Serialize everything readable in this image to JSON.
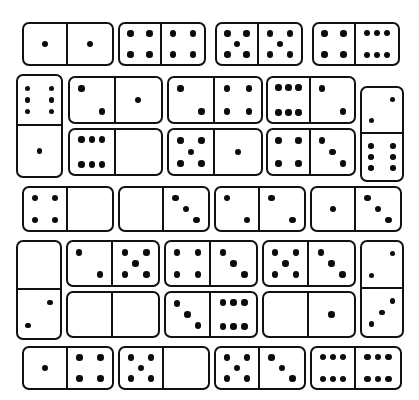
{
  "style": {
    "background": "#ffffff",
    "tile_fill": "#ffffff",
    "tile_border": "#111111",
    "pip_color": "#0c0c0c"
  },
  "board": {
    "width": 419,
    "height": 400,
    "tile_count": 28
  },
  "pip_layouts": {
    "0": [],
    "1": [
      [
        50,
        50
      ]
    ],
    "2": [
      [
        26,
        24
      ],
      [
        74,
        76
      ]
    ],
    "3": [
      [
        26,
        24
      ],
      [
        50,
        50
      ],
      [
        74,
        76
      ]
    ],
    "4": [
      [
        26,
        24
      ],
      [
        74,
        24
      ],
      [
        26,
        76
      ],
      [
        74,
        76
      ]
    ],
    "5": [
      [
        26,
        24
      ],
      [
        74,
        24
      ],
      [
        50,
        50
      ],
      [
        26,
        76
      ],
      [
        74,
        76
      ]
    ],
    "6": [
      [
        26,
        22
      ],
      [
        50,
        22
      ],
      [
        74,
        22
      ],
      [
        26,
        78
      ],
      [
        50,
        78
      ],
      [
        74,
        78
      ]
    ]
  },
  "tiles": [
    {
      "id": "t1",
      "name": "domino-1-1",
      "orientation": "horizontal",
      "values": [
        1,
        1
      ],
      "label": "1-1",
      "x": 22,
      "y": 22,
      "w": 92,
      "h": 44
    },
    {
      "id": "t2",
      "name": "domino-4-4",
      "orientation": "horizontal",
      "values": [
        4,
        4
      ],
      "label": "4-4",
      "x": 118,
      "y": 22,
      "w": 88,
      "h": 44
    },
    {
      "id": "t3",
      "name": "domino-5-5",
      "orientation": "horizontal",
      "values": [
        5,
        5
      ],
      "label": "5-5",
      "x": 215,
      "y": 22,
      "w": 88,
      "h": 44
    },
    {
      "id": "t4",
      "name": "domino-4-6",
      "orientation": "horizontal",
      "values": [
        4,
        6
      ],
      "label": "4-6",
      "x": 312,
      "y": 22,
      "w": 88,
      "h": 44
    },
    {
      "id": "t5",
      "name": "domino-6-1",
      "orientation": "vertical",
      "values": [
        6,
        1
      ],
      "label": "6-1",
      "x": 16,
      "y": 74,
      "w": 47,
      "h": 104
    },
    {
      "id": "t6",
      "name": "domino-2-1",
      "orientation": "horizontal",
      "values": [
        2,
        1
      ],
      "label": "2-1",
      "x": 68,
      "y": 76,
      "w": 95,
      "h": 48
    },
    {
      "id": "t7",
      "name": "domino-6-0",
      "orientation": "horizontal",
      "values": [
        6,
        0
      ],
      "label": "6-0",
      "x": 68,
      "y": 128,
      "w": 95,
      "h": 48
    },
    {
      "id": "t8",
      "name": "domino-2-4",
      "orientation": "horizontal",
      "values": [
        2,
        4
      ],
      "label": "2-4",
      "x": 167,
      "y": 76,
      "w": 96,
      "h": 48
    },
    {
      "id": "t9",
      "name": "domino-5-1",
      "orientation": "horizontal",
      "values": [
        5,
        1
      ],
      "label": "5-1",
      "x": 167,
      "y": 128,
      "w": 96,
      "h": 48
    },
    {
      "id": "t10",
      "name": "domino-6-2",
      "orientation": "horizontal",
      "values": [
        6,
        2
      ],
      "label": "6-2",
      "x": 266,
      "y": 76,
      "w": 90,
      "h": 48
    },
    {
      "id": "t11",
      "name": "domino-4-3",
      "orientation": "horizontal",
      "values": [
        4,
        3
      ],
      "label": "4-3",
      "x": 266,
      "y": 128,
      "w": 90,
      "h": 48
    },
    {
      "id": "t12",
      "name": "domino-2-6",
      "orientation": "vertical",
      "values": [
        2,
        6
      ],
      "label": "2-6",
      "x": 360,
      "y": 86,
      "w": 44,
      "h": 96
    },
    {
      "id": "t13",
      "name": "domino-4-0",
      "orientation": "horizontal",
      "values": [
        4,
        0
      ],
      "label": "4-0",
      "x": 22,
      "y": 186,
      "w": 92,
      "h": 46
    },
    {
      "id": "t14",
      "name": "domino-0-3",
      "orientation": "horizontal",
      "values": [
        0,
        3
      ],
      "label": "0-3",
      "x": 118,
      "y": 186,
      "w": 92,
      "h": 46
    },
    {
      "id": "t15",
      "name": "domino-2-2",
      "orientation": "horizontal",
      "values": [
        2,
        2
      ],
      "label": "2-2",
      "x": 214,
      "y": 186,
      "w": 92,
      "h": 46
    },
    {
      "id": "t16",
      "name": "domino-1-3",
      "orientation": "horizontal",
      "values": [
        1,
        3
      ],
      "label": "1-3",
      "x": 310,
      "y": 186,
      "w": 92,
      "h": 46
    },
    {
      "id": "t17",
      "name": "domino-0-2",
      "orientation": "vertical",
      "values": [
        0,
        2
      ],
      "label": "0-2",
      "x": 16,
      "y": 240,
      "w": 46,
      "h": 100
    },
    {
      "id": "t18",
      "name": "domino-2-5",
      "orientation": "horizontal",
      "values": [
        2,
        5
      ],
      "label": "2-5",
      "x": 66,
      "y": 240,
      "w": 94,
      "h": 47
    },
    {
      "id": "t19",
      "name": "domino-0-0",
      "orientation": "horizontal",
      "values": [
        0,
        0
      ],
      "label": "0-0",
      "x": 66,
      "y": 291,
      "w": 94,
      "h": 47
    },
    {
      "id": "t20",
      "name": "domino-4-3b",
      "orientation": "horizontal",
      "values": [
        4,
        3
      ],
      "label": "4-3",
      "x": 164,
      "y": 240,
      "w": 94,
      "h": 47
    },
    {
      "id": "t21",
      "name": "domino-3-6",
      "orientation": "horizontal",
      "values": [
        3,
        6
      ],
      "label": "3-6",
      "x": 164,
      "y": 291,
      "w": 94,
      "h": 47
    },
    {
      "id": "t22",
      "name": "domino-5-3",
      "orientation": "horizontal",
      "values": [
        5,
        3
      ],
      "label": "5-3",
      "x": 262,
      "y": 240,
      "w": 94,
      "h": 47
    },
    {
      "id": "t23",
      "name": "domino-0-1",
      "orientation": "horizontal",
      "values": [
        0,
        1
      ],
      "label": "0-1",
      "x": 262,
      "y": 291,
      "w": 94,
      "h": 47
    },
    {
      "id": "t24",
      "name": "domino-2-3",
      "orientation": "vertical",
      "values": [
        2,
        3
      ],
      "label": "2-3",
      "x": 360,
      "y": 240,
      "w": 44,
      "h": 98
    },
    {
      "id": "t25",
      "name": "domino-1-4",
      "orientation": "horizontal",
      "values": [
        1,
        4
      ],
      "label": "1-4",
      "x": 22,
      "y": 346,
      "w": 92,
      "h": 44
    },
    {
      "id": "t26",
      "name": "domino-5-0",
      "orientation": "horizontal",
      "values": [
        5,
        0
      ],
      "label": "5-0",
      "x": 118,
      "y": 346,
      "w": 92,
      "h": 44
    },
    {
      "id": "t27",
      "name": "domino-5-3b",
      "orientation": "horizontal",
      "values": [
        5,
        3
      ],
      "label": "5-3",
      "x": 214,
      "y": 346,
      "w": 92,
      "h": 44
    },
    {
      "id": "t28",
      "name": "domino-6-6",
      "orientation": "horizontal",
      "values": [
        6,
        6
      ],
      "label": "6-6",
      "x": 310,
      "y": 346,
      "w": 92,
      "h": 44
    }
  ]
}
